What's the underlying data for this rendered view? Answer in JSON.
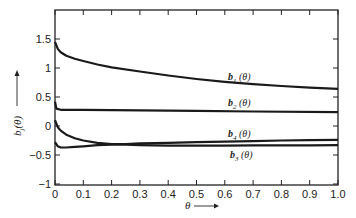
{
  "chart_data": {
    "type": "line",
    "title": "",
    "xlabel": "θ",
    "ylabel": "b_j(θ)",
    "xlim": [
      0,
      1.0
    ],
    "ylim": [
      -1,
      2
    ],
    "grid": false,
    "legend": "inline labels",
    "x_ticks": [
      "0",
      "0.1",
      "0.2",
      "0.3",
      "0.4",
      "0.5",
      "0.6",
      "0.7",
      "0.8",
      "0.9",
      "1.0"
    ],
    "y_ticks": [
      "−1",
      "−0.5",
      "0",
      "0.5",
      "1",
      "1.5"
    ],
    "series": [
      {
        "name": "b1(θ)",
        "label_main": "b",
        "label_sub": "1",
        "label_arg": "(θ)",
        "x": [
          0,
          0.01,
          0.02,
          0.04,
          0.07,
          0.1,
          0.15,
          0.2,
          0.3,
          0.4,
          0.5,
          0.6,
          0.7,
          0.8,
          0.9,
          1.0
        ],
        "y": [
          1.45,
          1.33,
          1.27,
          1.21,
          1.16,
          1.12,
          1.06,
          1.01,
          0.94,
          0.87,
          0.81,
          0.76,
          0.72,
          0.69,
          0.66,
          0.64
        ]
      },
      {
        "name": "b2(θ)",
        "label_main": "b",
        "label_sub": "2",
        "label_arg": "(θ)",
        "x": [
          0,
          0.005,
          0.02,
          0.1,
          0.3,
          0.5,
          0.7,
          1.0
        ],
        "y": [
          0.42,
          0.3,
          0.28,
          0.28,
          0.27,
          0.26,
          0.25,
          0.24
        ]
      },
      {
        "name": "b4(θ)",
        "label_main": "b",
        "label_sub": "4",
        "label_arg": "(θ)",
        "x": [
          0,
          0.01,
          0.02,
          0.04,
          0.07,
          0.1,
          0.15,
          0.2,
          0.25,
          0.3,
          0.4,
          0.5,
          0.6,
          0.7,
          0.8,
          0.9,
          1.0
        ],
        "y": [
          0.1,
          -0.02,
          -0.08,
          -0.15,
          -0.21,
          -0.25,
          -0.29,
          -0.31,
          -0.31,
          -0.3,
          -0.29,
          -0.28,
          -0.27,
          -0.26,
          -0.25,
          -0.245,
          -0.24
        ]
      },
      {
        "name": "b3(θ)",
        "label_main": "b",
        "label_sub": "3",
        "label_arg": "(θ)",
        "x": [
          0,
          0.01,
          0.02,
          0.04,
          0.07,
          0.1,
          0.15,
          0.2,
          0.25,
          0.3,
          0.4,
          0.5,
          0.6,
          0.7,
          0.8,
          0.9,
          1.0
        ],
        "y": [
          -0.28,
          -0.35,
          -0.37,
          -0.37,
          -0.36,
          -0.35,
          -0.33,
          -0.32,
          -0.32,
          -0.33,
          -0.34,
          -0.34,
          -0.34,
          -0.335,
          -0.333,
          -0.332,
          -0.33
        ]
      }
    ]
  }
}
